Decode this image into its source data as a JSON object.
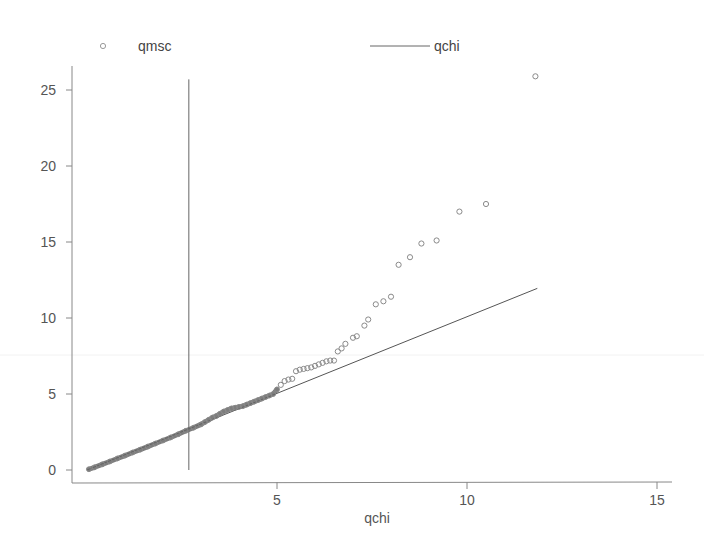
{
  "chart_data": {
    "type": "scatter",
    "title": "",
    "xlabel": "qchi",
    "ylabel": "",
    "xlim": [
      0,
      15.3
    ],
    "ylim": [
      -0.8,
      26.5
    ],
    "x_ticks": [
      5,
      10,
      15
    ],
    "y_ticks": [
      0,
      5,
      10,
      15,
      20,
      25
    ],
    "grid": false,
    "legend_position": "top",
    "legend": [
      {
        "label": "qmsc",
        "marker": "hollow-circle"
      },
      {
        "label": "qchi",
        "marker": "line"
      }
    ],
    "colors": {
      "points": "#8a8a8a",
      "line": "#555555",
      "axis": "#888888",
      "dense_points": "#666666"
    },
    "reference_vline": {
      "x": 2.68,
      "y_from": 0,
      "y_to": 25.7
    },
    "series": [
      {
        "name": "qmsc",
        "type": "scatter",
        "points": [
          [
            0.05,
            0.05
          ],
          [
            0.2,
            0.18
          ],
          [
            0.4,
            0.37
          ],
          [
            0.6,
            0.56
          ],
          [
            0.8,
            0.76
          ],
          [
            1.0,
            0.95
          ],
          [
            1.2,
            1.15
          ],
          [
            1.4,
            1.34
          ],
          [
            1.6,
            1.54
          ],
          [
            1.8,
            1.74
          ],
          [
            2.0,
            1.94
          ],
          [
            2.2,
            2.14
          ],
          [
            2.4,
            2.35
          ],
          [
            2.6,
            2.58
          ],
          [
            2.8,
            2.78
          ],
          [
            3.0,
            3.0
          ],
          [
            3.1,
            3.15
          ],
          [
            3.2,
            3.3
          ],
          [
            3.3,
            3.45
          ],
          [
            3.4,
            3.55
          ],
          [
            3.5,
            3.7
          ],
          [
            3.6,
            3.85
          ],
          [
            3.7,
            3.95
          ],
          [
            3.8,
            4.05
          ],
          [
            3.9,
            4.1
          ],
          [
            4.0,
            4.15
          ],
          [
            4.1,
            4.2
          ],
          [
            4.2,
            4.3
          ],
          [
            4.3,
            4.4
          ],
          [
            4.4,
            4.5
          ],
          [
            4.5,
            4.6
          ],
          [
            4.6,
            4.7
          ],
          [
            4.7,
            4.8
          ],
          [
            4.8,
            4.9
          ],
          [
            4.9,
            5.0
          ],
          [
            5.0,
            5.3
          ],
          [
            5.1,
            5.6
          ],
          [
            5.2,
            5.85
          ],
          [
            5.3,
            5.95
          ],
          [
            5.4,
            6.0
          ],
          [
            5.5,
            6.5
          ],
          [
            5.6,
            6.6
          ],
          [
            5.7,
            6.65
          ],
          [
            5.8,
            6.7
          ],
          [
            5.9,
            6.75
          ],
          [
            6.0,
            6.85
          ],
          [
            6.1,
            6.95
          ],
          [
            6.2,
            7.05
          ],
          [
            6.3,
            7.15
          ],
          [
            6.4,
            7.2
          ],
          [
            6.5,
            7.2
          ],
          [
            6.6,
            7.8
          ],
          [
            6.7,
            8.0
          ],
          [
            6.8,
            8.3
          ],
          [
            7.0,
            8.7
          ],
          [
            7.1,
            8.8
          ],
          [
            7.3,
            9.5
          ],
          [
            7.4,
            9.9
          ],
          [
            7.6,
            10.9
          ],
          [
            7.8,
            11.1
          ],
          [
            8.0,
            11.4
          ],
          [
            8.2,
            13.5
          ],
          [
            8.5,
            14.0
          ],
          [
            8.8,
            14.9
          ],
          [
            9.2,
            15.1
          ],
          [
            9.8,
            17.0
          ],
          [
            10.5,
            17.5
          ],
          [
            11.8,
            25.9
          ]
        ]
      },
      {
        "name": "qchi",
        "type": "line",
        "points": [
          [
            0.0,
            0.0
          ],
          [
            11.85,
            11.95
          ]
        ]
      }
    ]
  }
}
